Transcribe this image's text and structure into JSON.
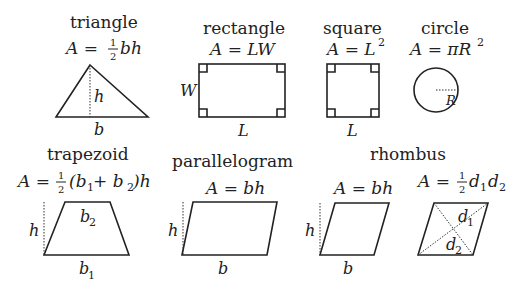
{
  "shapes": {
    "triangle": {
      "name": "triangle",
      "formula_lhs": "A = ",
      "formula_frac_num": "1",
      "formula_frac_den": "2",
      "formula_rhs": "bh",
      "label_height": "h",
      "label_base": "b"
    },
    "rectangle": {
      "name": "rectangle",
      "formula": "A = LW",
      "label_width": "W",
      "label_length": "L"
    },
    "square": {
      "name": "square",
      "formula_lhs": "A = L",
      "formula_sup": "2",
      "label_length": "L"
    },
    "circle": {
      "name": "circle",
      "formula_lhs": "A = πR",
      "formula_sup": "2",
      "label_radius": "R"
    },
    "trapezoid": {
      "name": "trapezoid",
      "formula_lhs": "A = ",
      "formula_frac_num": "1",
      "formula_frac_den": "2",
      "formula_rhs_1": "(b",
      "formula_sub_1": "1",
      "formula_rhs_2": " + b",
      "formula_sub_2": "2",
      "formula_rhs_3": ")h",
      "label_height": "h",
      "label_top": "b",
      "label_top_sub": "2",
      "label_bottom": "b",
      "label_bottom_sub": "1"
    },
    "parallelogram": {
      "name": "parallelogram",
      "formula": "A = bh",
      "label_height": "h",
      "label_base": "b"
    },
    "rhombus": {
      "name": "rhombus",
      "formula_1": "A = bh",
      "label_height": "h",
      "label_base": "b",
      "formula_2_lhs": "A = ",
      "formula_2_frac_num": "1",
      "formula_2_frac_den": "2",
      "formula_2_d": "d",
      "formula_2_sub1": "1",
      "formula_2_d2": "d",
      "formula_2_sub2": "2",
      "label_d1": "d",
      "label_d1_sub": "1",
      "label_d2": "d",
      "label_d2_sub": "2"
    }
  }
}
